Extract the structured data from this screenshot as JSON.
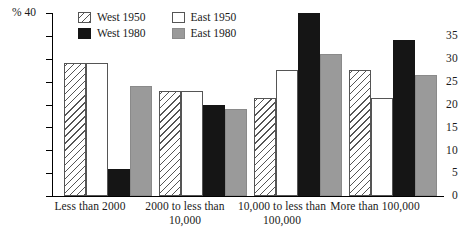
{
  "chart_data": {
    "type": "bar",
    "title": "",
    "xlabel": "",
    "ylabel": "%",
    "ylim": [
      0,
      40
    ],
    "yticks": [
      0,
      5,
      10,
      15,
      20,
      25,
      30,
      35,
      40
    ],
    "grid": false,
    "legend_position": "top-center",
    "categories": [
      "Less than 2000",
      "2000 to less than 10,000",
      "10,000 to less than 100,000",
      "More than 100,000"
    ],
    "series": [
      {
        "name": "West 1950",
        "fill": "hatch",
        "color": "#ffffff",
        "values": [
          29,
          23,
          21.5,
          27.5
        ]
      },
      {
        "name": "East 1950",
        "fill": "white",
        "color": "#ffffff",
        "values": [
          29,
          23,
          27.5,
          21.5
        ]
      },
      {
        "name": "West 1980",
        "fill": "black",
        "color": "#151515",
        "values": [
          6,
          20,
          40,
          34
        ]
      },
      {
        "name": "East 1980",
        "fill": "gray",
        "color": "#9a9a9a",
        "values": [
          24,
          19,
          31,
          26.5
        ]
      }
    ]
  },
  "axis": {
    "percent_symbol": "%",
    "tick_40": "40",
    "tick_35": "35",
    "tick_30": "30",
    "tick_25": "25",
    "tick_20": "20",
    "tick_15": "15",
    "tick_10": "10",
    "tick_5": "5",
    "tick_0": "0"
  },
  "legend": {
    "items": [
      {
        "label": "West 1950"
      },
      {
        "label": "East 1950"
      },
      {
        "label": "West 1980"
      },
      {
        "label": "East 1980"
      }
    ]
  },
  "categories_display": [
    {
      "line1": "Less than 2000",
      "line2": ""
    },
    {
      "line1": "2000 to less than",
      "line2": "10,000"
    },
    {
      "line1": "10,000 to less than",
      "line2": "100,000"
    },
    {
      "line1": "More than 100,000",
      "line2": ""
    }
  ]
}
